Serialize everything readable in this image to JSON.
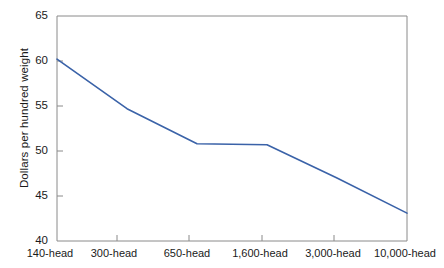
{
  "chart_data": {
    "type": "line",
    "title": "",
    "subtitle": "",
    "xlabel": "",
    "ylabel": "Dollars per hundred weight",
    "categories": [
      "140-head",
      "300-head",
      "650-head",
      "1,600-head",
      "3,000-head",
      "10,000-head"
    ],
    "values": [
      60.2,
      54.7,
      50.8,
      50.7,
      47.0,
      43.1
    ],
    "series": [
      {
        "name": "Dollars per hundred weight",
        "values": [
          60.2,
          54.7,
          50.8,
          50.7,
          47.0,
          43.1
        ]
      }
    ],
    "ylim": [
      40,
      65
    ],
    "yticks": [
      40,
      45,
      50,
      55,
      60,
      65
    ],
    "ytick_labels": [
      "40",
      "45",
      "50",
      "55",
      "60",
      "65"
    ],
    "xtick_labels": [
      "140-head",
      "300-head",
      "650-head",
      "1,600-head",
      "3,000-head",
      "10,000-head"
    ],
    "grid": false,
    "legend": false,
    "legend_position": "none",
    "line_color": "#3a62a8",
    "axis_color": "#7a7a7a",
    "background_color": "#ffffff",
    "text_color": "#1a1a1a"
  }
}
